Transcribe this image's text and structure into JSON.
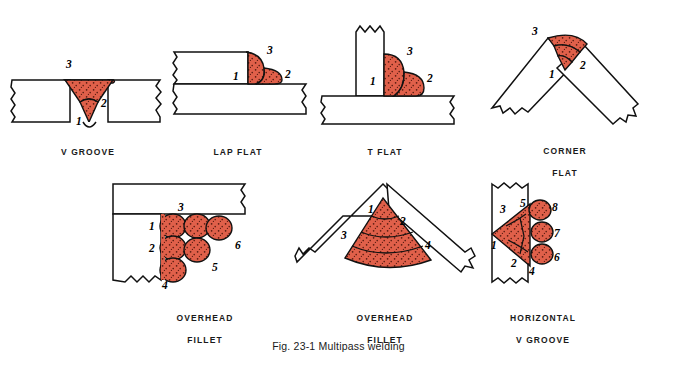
{
  "figure": {
    "caption": "Fig. 23-1  Multipass welding",
    "background_color": "#ffffff",
    "weld_fill_color": "#e0604a",
    "weld_speckle_color": "#5a1b10",
    "outline_color": "#111111"
  },
  "diagrams": [
    {
      "id": "v-groove",
      "label": "V GROOVE",
      "label_lines": [
        "V  GROOVE"
      ],
      "pass_count": 3,
      "passes": [
        "1",
        "2",
        "3"
      ]
    },
    {
      "id": "lap-flat",
      "label": "LAP FLAT",
      "label_lines": [
        "LAP FLAT"
      ],
      "pass_count": 3,
      "passes": [
        "1",
        "2",
        "3"
      ]
    },
    {
      "id": "t-flat",
      "label": "T FLAT",
      "label_lines": [
        "T  FLAT"
      ],
      "pass_count": 3,
      "passes": [
        "1",
        "2",
        "3"
      ]
    },
    {
      "id": "corner-flat",
      "label": "CORNER FLAT",
      "label_lines": [
        "CORNER",
        "FLAT"
      ],
      "pass_count": 3,
      "passes": [
        "1",
        "2",
        "3"
      ]
    },
    {
      "id": "overhead-fillet-1",
      "label": "OVERHEAD FILLET",
      "label_lines": [
        "OVERHEAD",
        "FILLET"
      ],
      "pass_count": 6,
      "passes": [
        "1",
        "2",
        "3",
        "4",
        "5",
        "6"
      ]
    },
    {
      "id": "overhead-fillet-2",
      "label": "OVERHEAD FILLET",
      "label_lines": [
        "OVERHEAD",
        "FILLET"
      ],
      "pass_count": 4,
      "passes": [
        "1",
        "2",
        "3",
        "4"
      ]
    },
    {
      "id": "horizontal-v-groove",
      "label": "HORIZONTAL V GROOVE",
      "label_lines": [
        "HORIZONTAL",
        "V  GROOVE"
      ],
      "pass_count": 8,
      "passes": [
        "1",
        "2",
        "3",
        "4",
        "5",
        "6",
        "7",
        "8"
      ]
    }
  ]
}
